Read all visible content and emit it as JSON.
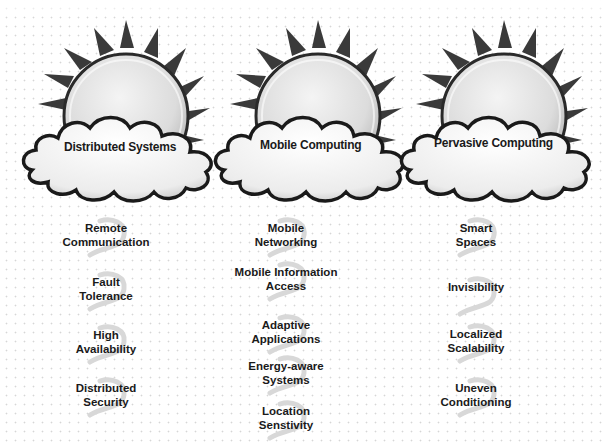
{
  "diagram": {
    "columns": [
      {
        "title": "Distributed Systems",
        "items": [
          {
            "line1": "Remote",
            "line2": "Communication"
          },
          {
            "line1": "Fault",
            "line2": "Tolerance"
          },
          {
            "line1": "High",
            "line2": "Availability"
          },
          {
            "line1": "Distributed",
            "line2": "Security"
          }
        ]
      },
      {
        "title": "Mobile Computing",
        "items": [
          {
            "line1": "Mobile",
            "line2": "Networking"
          },
          {
            "line1": "Mobile Information",
            "line2": "Access"
          },
          {
            "line1": "Adaptive",
            "line2": "Applications"
          },
          {
            "line1": "Energy-aware",
            "line2": "Systems"
          },
          {
            "line1": "Location",
            "line2": "Senstivity"
          }
        ]
      },
      {
        "title": "Pervasive Computing",
        "items": [
          {
            "line1": "Smart",
            "line2": "Spaces"
          },
          {
            "line1": "Invisibility",
            "line2": ""
          },
          {
            "line1": "Localized",
            "line2": "Scalability"
          },
          {
            "line1": "Uneven",
            "line2": "Conditioning"
          }
        ]
      }
    ],
    "icons": {
      "sun": "sun-icon",
      "cloud": "cloud-icon",
      "swirl": "swirl-icon"
    },
    "colors": {
      "background": "#ffffff",
      "grid_dots": "#d6d6d6",
      "outline": "#1a1a1a",
      "sun_face": "#e4e4e4",
      "sun_rays": "#3a3a3a",
      "cloud_fill": "#f2f2f2",
      "text": "#1a1a1a"
    }
  }
}
